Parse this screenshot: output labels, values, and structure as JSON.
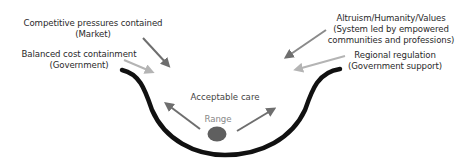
{
  "diagram": {
    "labels": {
      "competitive": {
        "line1": "Competitive pressures contained",
        "line2": "(Market)"
      },
      "balanced": {
        "line1": "Balanced cost containment",
        "line2": "(Government)"
      },
      "altruism": {
        "line1": "Altruism/Humanity/Values",
        "line2": "(System led by empowered",
        "line3": "communities and professions)"
      },
      "regional": {
        "line1": "Regional regulation",
        "line2": "(Government support)"
      },
      "acceptable_care": "Acceptable care",
      "range": "Range"
    },
    "colors": {
      "curve": "#111111",
      "arrow_dark": "#6e6e6e",
      "arrow_light": "#b4b4b4",
      "ball": "#5f5f5f",
      "text": "#2a2a2a",
      "range_text": "#888888"
    }
  }
}
